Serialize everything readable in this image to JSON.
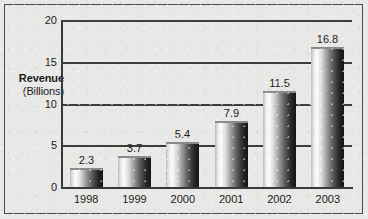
{
  "chart_data": {
    "type": "bar",
    "title": "",
    "subtitle": "",
    "xlabel": "",
    "ylabel": "Revenue (Billions)",
    "ylabel_line1": "Revenue",
    "ylabel_line2": "(Billions)",
    "categories": [
      "1998",
      "1999",
      "2000",
      "2001",
      "2002",
      "2003"
    ],
    "values": [
      2.3,
      3.7,
      5.4,
      7.9,
      11.5,
      16.8
    ],
    "value_labels": [
      "2.3",
      "3.7",
      "5.4",
      "7.9",
      "11.5",
      "16.8"
    ],
    "ylim": [
      0,
      20
    ],
    "yticks": [
      0,
      5,
      10,
      15,
      20
    ],
    "ytick_labels": [
      "0",
      "5",
      "10",
      "15",
      "20"
    ],
    "grid": true,
    "grid_axis": "y",
    "legend": false,
    "legend_position": "none",
    "series": [
      {
        "name": "Revenue",
        "values": [
          2.3,
          3.7,
          5.4,
          7.9,
          11.5,
          16.8
        ]
      }
    ],
    "annotations": [],
    "colors": {
      "background": "#e8e8e6",
      "frame": "#4a4a4a",
      "axis": "#3a3a3a",
      "gridline": "#3d3d3d",
      "text": "#1b1b1b",
      "bar_light": "#fbfbfb",
      "bar_dark": "#151515"
    }
  }
}
